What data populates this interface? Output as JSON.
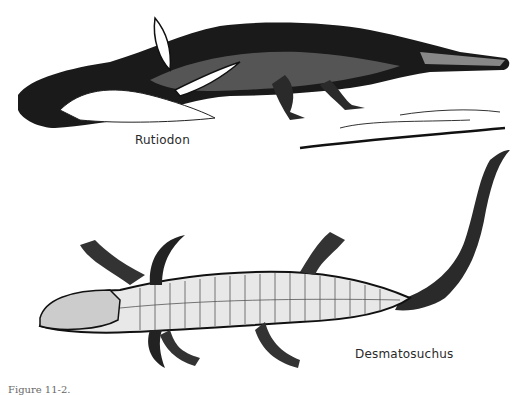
{
  "figure": {
    "labels": {
      "top_animal": "Rutiodon",
      "bottom_animal": "Desmatosuchus"
    },
    "caption_visible": "Figure 11-2."
  }
}
